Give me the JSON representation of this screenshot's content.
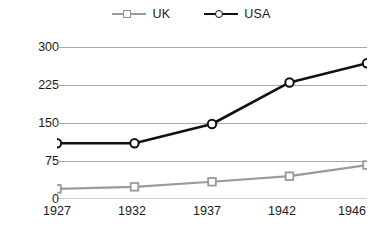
{
  "chart_data": {
    "type": "line",
    "title": "",
    "xlabel": "",
    "ylabel": "",
    "categories": [
      "1927",
      "1932",
      "1937",
      "1942",
      "1946"
    ],
    "x": [
      1927,
      1932,
      1937,
      1942,
      1946
    ],
    "ylim": [
      0,
      300
    ],
    "yticks": [
      0,
      75,
      150,
      225,
      300
    ],
    "ytick_labels": [
      "0",
      "75",
      "150",
      "225",
      "300"
    ],
    "xtick_labels": [
      "1927",
      "1932",
      "1937",
      "1942",
      "1946"
    ],
    "grid": "horizontal",
    "legend_position": "top-center",
    "series": [
      {
        "name": "UK",
        "values": [
          20,
          24,
          34,
          45,
          67
        ],
        "color": "#9a9a9a",
        "marker": "square"
      },
      {
        "name": "USA",
        "values": [
          110,
          110,
          148,
          230,
          268
        ],
        "color": "#111111",
        "marker": "circle"
      }
    ]
  },
  "legend": {
    "entries": [
      {
        "label": "UK",
        "marker_icon": "square-marker-icon"
      },
      {
        "label": "USA",
        "marker_icon": "circle-marker-icon"
      }
    ]
  },
  "axes": {
    "y_labels": [
      "300",
      "225",
      "150",
      "75",
      "0"
    ],
    "x_labels": [
      "1927",
      "1932",
      "1937",
      "1942",
      "1946"
    ]
  },
  "colors": {
    "uk_series": "#9a9a9a",
    "usa_series": "#111111",
    "gridline": "#a8a8a8",
    "axis": "#333333",
    "background": "#ffffff"
  }
}
